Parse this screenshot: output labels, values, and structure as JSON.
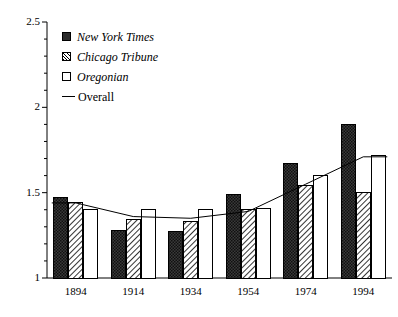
{
  "chart_data": {
    "type": "bar",
    "title": "",
    "subtitle": "",
    "xlabel": "",
    "ylabel": "",
    "categories": [
      "1894",
      "1914",
      "1934",
      "1954",
      "1974",
      "1994"
    ],
    "ylim": [
      1,
      2.5
    ],
    "ytick_labels": [
      "1",
      "1.5",
      "2",
      "2.5"
    ],
    "ytick_values": [
      1,
      1.5,
      2,
      2.5
    ],
    "minor_ticks": true,
    "grid": false,
    "legend_position": "top-left",
    "series": [
      {
        "name": "New York Times",
        "style": "bar-solid",
        "values": [
          1.47,
          1.28,
          1.27,
          1.49,
          1.67,
          1.9
        ]
      },
      {
        "name": "Chicago Tribune",
        "style": "bar-hatched",
        "values": [
          1.44,
          1.34,
          1.33,
          1.4,
          1.54,
          1.5
        ]
      },
      {
        "name": "Oregonian",
        "style": "bar-open",
        "values": [
          1.4,
          1.4,
          1.4,
          1.41,
          1.6,
          1.72
        ]
      },
      {
        "name": "Overall",
        "style": "line",
        "values": [
          1.44,
          1.36,
          1.35,
          1.39,
          1.55,
          1.71
        ]
      }
    ]
  },
  "legend": {
    "items": [
      {
        "label": "New York Times",
        "marker": "solid-square-icon"
      },
      {
        "label": "Chicago Tribune",
        "marker": "hatched-square-icon"
      },
      {
        "label": "Oregonian",
        "marker": "open-square-icon"
      },
      {
        "label": "Overall",
        "marker": "line-segment-icon"
      }
    ]
  },
  "axes": {
    "y_labels": [
      "2.5",
      "2",
      "1.5",
      "1"
    ],
    "x_labels": [
      "1894",
      "1914",
      "1934",
      "1954",
      "1974",
      "1994"
    ]
  },
  "colors": {
    "axis": "#000000",
    "bar_solid": "#2b2b2b",
    "bar_open": "#ffffff",
    "bar_border": "#000000",
    "line": "#000000",
    "background": "#ffffff"
  }
}
